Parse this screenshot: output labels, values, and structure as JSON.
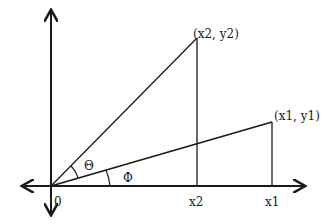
{
  "diagram": {
    "title": "",
    "labels": {
      "origin": "0",
      "point2": "(x2, y2)",
      "point1": "(x1, y1)",
      "x2_tick": "x2",
      "x1_tick": "x1",
      "theta": "Θ",
      "phi": "Φ"
    },
    "geometry": {
      "origin": [
        51,
        186
      ],
      "point2": [
        197,
        38
      ],
      "point1": [
        272,
        122
      ],
      "axis_x_range": [
        22,
        305
      ],
      "axis_y_range": [
        10,
        215
      ]
    },
    "colors": {
      "stroke": "#1a1a1a",
      "background": "#ffffff"
    }
  }
}
